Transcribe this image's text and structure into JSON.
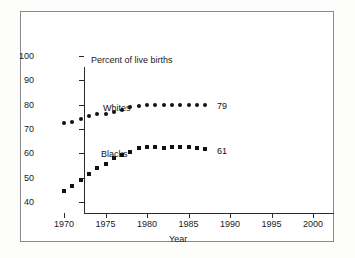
{
  "chart_data": {
    "type": "scatter",
    "title": "",
    "xlabel": "Year",
    "ylabel": "Percent of live births",
    "xlim": [
      1970,
      2000
    ],
    "ylim": [
      40,
      100
    ],
    "xticks": [
      1970,
      1975,
      1980,
      1985,
      1990,
      1995,
      2000
    ],
    "yticks": [
      40,
      50,
      60,
      70,
      80,
      90,
      100
    ],
    "grid": false,
    "legend_position": "inline-annotation",
    "x": [
      1970,
      1971,
      1972,
      1973,
      1974,
      1975,
      1976,
      1977,
      1978,
      1979,
      1980,
      1981,
      1982,
      1983,
      1984,
      1985,
      1986,
      1987
    ],
    "series": [
      {
        "name": "Whites",
        "marker": "circle",
        "end_label": "79",
        "values": [
          72.4,
          73.0,
          74.0,
          75.3,
          76.1,
          76.3,
          77.0,
          77.8,
          79.0,
          79.6,
          79.8,
          79.8,
          79.8,
          79.8,
          79.9,
          79.8,
          79.7,
          79.9
        ]
      },
      {
        "name": "Blacks",
        "marker": "square",
        "end_label": "61",
        "values": [
          44.5,
          46.6,
          48.9,
          51.7,
          53.8,
          55.8,
          57.9,
          59.2,
          60.7,
          62.0,
          62.8,
          62.4,
          62.3,
          62.6,
          62.7,
          62.4,
          62.3,
          61.8
        ]
      }
    ]
  }
}
